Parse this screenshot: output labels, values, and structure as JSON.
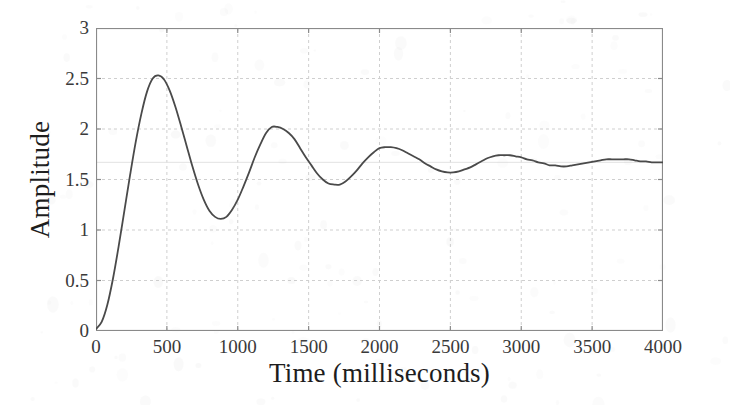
{
  "chart_data": {
    "type": "line",
    "title": "",
    "xlabel": "Time (milliseconds)",
    "ylabel": "Amplitude",
    "xlim": [
      0,
      4000
    ],
    "ylim": [
      0,
      3
    ],
    "grid": true,
    "legend": null,
    "xticks": [
      0,
      500,
      1000,
      1500,
      2000,
      2500,
      3000,
      3500,
      4000
    ],
    "xticklabels": [
      "0",
      "500",
      "1000",
      "1500",
      "2000",
      "2500",
      "3000",
      "3500",
      "4000"
    ],
    "yticks": [
      0,
      0.5,
      1,
      1.5,
      2,
      2.5,
      3
    ],
    "yticklabels": [
      "0",
      "0.5",
      "1",
      "1.5",
      "2",
      "2.5",
      "3"
    ],
    "line_color": "#4a4a4a",
    "line_width": 1.8,
    "grid_color": "#cfcfcf",
    "axis_color": "#8a8a8a",
    "background": "#ffffff",
    "annotations": {
      "steady_state": 1.67,
      "first_peak_value": 2.53,
      "first_peak_time": 380,
      "first_trough_value": 1.11,
      "first_trough_time": 720,
      "second_peak_value": 2.02,
      "second_peak_time": 1070,
      "second_trough_value": 1.45,
      "second_trough_time": 1430,
      "third_peak_value": 1.82,
      "third_peak_time": 1780,
      "damped_period": 700,
      "description": "Underdamped second-order step response settling at 1.67"
    },
    "series": [
      {
        "name": "step response",
        "x": [
          0,
          40,
          80,
          120,
          160,
          200,
          240,
          280,
          320,
          360,
          400,
          440,
          480,
          520,
          560,
          600,
          640,
          680,
          720,
          760,
          800,
          840,
          880,
          920,
          960,
          1000,
          1040,
          1080,
          1120,
          1160,
          1200,
          1240,
          1280,
          1320,
          1360,
          1400,
          1440,
          1480,
          1520,
          1560,
          1600,
          1640,
          1680,
          1720,
          1760,
          1800,
          1840,
          1880,
          1920,
          1960,
          2000,
          2040,
          2080,
          2120,
          2160,
          2200,
          2240,
          2280,
          2320,
          2360,
          2400,
          2440,
          2480,
          2520,
          2560,
          2600,
          2640,
          2680,
          2720,
          2760,
          2800,
          2840,
          2880,
          2920,
          2960,
          3000,
          3040,
          3080,
          3120,
          3160,
          3200,
          3240,
          3280,
          3320,
          3360,
          3400,
          3440,
          3480,
          3520,
          3560,
          3600,
          3640,
          3680,
          3720,
          3760,
          3800,
          3840,
          3880,
          3920,
          3960,
          4000
        ],
        "y": [
          0.02,
          0.09,
          0.26,
          0.52,
          0.84,
          1.19,
          1.54,
          1.87,
          2.15,
          2.37,
          2.5,
          2.53,
          2.49,
          2.38,
          2.22,
          2.03,
          1.83,
          1.63,
          1.45,
          1.3,
          1.19,
          1.13,
          1.11,
          1.13,
          1.2,
          1.3,
          1.43,
          1.57,
          1.72,
          1.85,
          1.96,
          2.02,
          2.02,
          2.0,
          1.96,
          1.9,
          1.81,
          1.72,
          1.64,
          1.56,
          1.5,
          1.46,
          1.45,
          1.45,
          1.48,
          1.53,
          1.59,
          1.66,
          1.72,
          1.77,
          1.81,
          1.82,
          1.82,
          1.81,
          1.79,
          1.76,
          1.73,
          1.7,
          1.66,
          1.63,
          1.6,
          1.58,
          1.57,
          1.57,
          1.58,
          1.6,
          1.62,
          1.65,
          1.68,
          1.71,
          1.73,
          1.74,
          1.74,
          1.74,
          1.73,
          1.72,
          1.7,
          1.69,
          1.67,
          1.66,
          1.64,
          1.64,
          1.63,
          1.63,
          1.64,
          1.65,
          1.66,
          1.67,
          1.68,
          1.69,
          1.7,
          1.7,
          1.7,
          1.7,
          1.7,
          1.69,
          1.68,
          1.68,
          1.67,
          1.67,
          1.67
        ]
      }
    ]
  }
}
